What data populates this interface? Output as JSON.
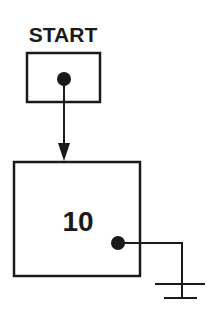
{
  "diagram": {
    "type": "linked-list-pointer",
    "start_label": "START",
    "node_value": "10",
    "next_pointer": "null (ground symbol)",
    "colors": {
      "stroke": "#1a1a1a",
      "background": "#ffffff"
    }
  }
}
